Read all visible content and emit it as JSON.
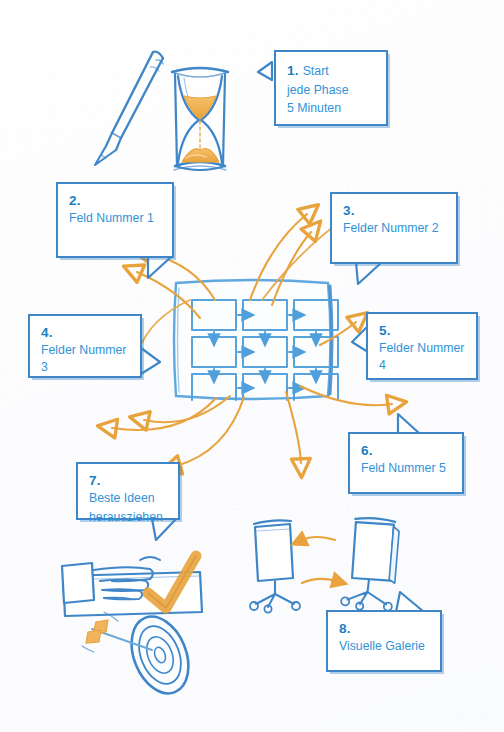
{
  "page": {
    "background_color": "#fdfdfe",
    "accent_blue": "#3f86c8",
    "text_blue": "#2f93d8",
    "number_blue": "#1a7fc1",
    "accent_orange": "#e8a33d"
  },
  "callouts": [
    {
      "id": 1,
      "number": "1.",
      "text": "Start",
      "text2": "jede Phase",
      "text3": "5 Minuten",
      "tail": "left"
    },
    {
      "id": 2,
      "number": "2.",
      "text": "Feld Nummer 1",
      "tail": "bottom"
    },
    {
      "id": 3,
      "number": "3.",
      "text": "Felder Nummer 2",
      "tail": "bottom"
    },
    {
      "id": 4,
      "number": "4.",
      "text": "Felder Nummer 3",
      "tail": "right"
    },
    {
      "id": 5,
      "number": "5.",
      "text": "Felder Nummer 4",
      "tail": "left"
    },
    {
      "id": 6,
      "number": "6.",
      "text": "Feld Nummer 5",
      "tail": "top"
    },
    {
      "id": 7,
      "number": "7.",
      "text": "Beste Ideen",
      "text2": "herausziehen",
      "tail": "bottom"
    },
    {
      "id": 8,
      "number": "8.",
      "text": "Visuelle Galerie",
      "tail": "top"
    }
  ],
  "illustrations": [
    {
      "name": "pen-and-hourglass-sketch",
      "description": "pen and hourglass with orange sand"
    },
    {
      "name": "grid-3x3-sketch",
      "description": "3 by 3 grid of idea fields with arrows"
    },
    {
      "name": "hand-checkmark-sketch",
      "description": "hand holding paper with orange check mark"
    },
    {
      "name": "dart-target-sketch",
      "description": "orange dart hitting a blue target"
    },
    {
      "name": "flipchart-exchange-sketch",
      "description": "two flipchart easels exchanging with orange arrows"
    }
  ],
  "arrows": {
    "count": 10,
    "color": "#e8a33d",
    "description": "curved arrows radiating between central grid and callouts"
  }
}
